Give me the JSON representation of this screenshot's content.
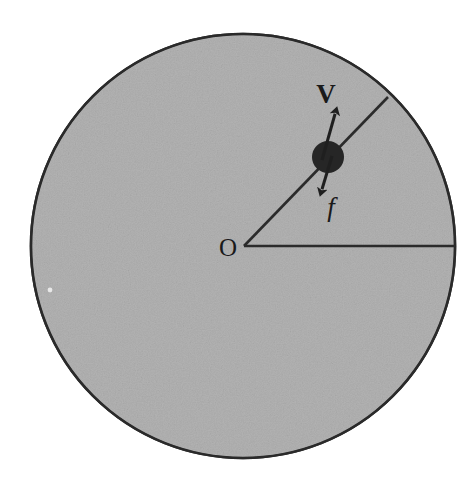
{
  "figure": {
    "canvas": {
      "width": 475,
      "height": 488,
      "background": "#ffffff"
    },
    "disk": {
      "name": "rotating-disk",
      "center_x": 243,
      "center_y": 246,
      "radius": 212,
      "fill_color": "#ababab",
      "outline_color": "#2b2b2b",
      "outline_width": 2.6,
      "texture": "noise-grain"
    },
    "center_label": {
      "text": "O",
      "x": 228,
      "y": 256
    },
    "radius_horizontal": {
      "name": "radius-line-horizontal",
      "x1": 244,
      "y1": 246,
      "x2": 455,
      "y2": 246,
      "width": 2.6
    },
    "radius_diagonal": {
      "name": "radius-line-diagonal",
      "x1": 244,
      "y1": 246,
      "x2": 388,
      "y2": 97,
      "width": 2.6,
      "angle_degrees": 46
    },
    "particle": {
      "name": "particle-ball",
      "cx": 328,
      "cy": 157,
      "r": 16,
      "fill_color": "#262626"
    },
    "velocity_vector": {
      "label": "V",
      "label_x": 326,
      "label_y": 103,
      "tail_x": 322,
      "tail_y": 160,
      "tip_x": 337,
      "tip_y": 107,
      "color": "#1f1f1f"
    },
    "friction_vector": {
      "label": "f",
      "label_x": 331,
      "label_y": 216,
      "tail_x": 332,
      "tail_y": 156,
      "tip_x": 320,
      "tip_y": 196,
      "color": "#1f1f1f"
    }
  }
}
